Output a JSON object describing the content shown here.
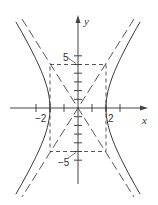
{
  "figure": {
    "type": "hyperbola-graph",
    "equation": "x^2/4 - y^2/25 = 1",
    "axes": {
      "x_label": "x",
      "y_label": "y",
      "x_range": [
        -4.9,
        4.9
      ],
      "y_range": [
        -9.0,
        10.5
      ],
      "x_ticks": [
        -3,
        -2,
        -1,
        1,
        2,
        3
      ],
      "y_ticks": [
        -6,
        -5,
        -4,
        -3,
        -2,
        -1,
        1,
        2,
        3,
        4,
        5,
        6
      ],
      "x_tick_labels": [
        {
          "value": -2,
          "text": "−2"
        },
        {
          "value": 2,
          "text": "2"
        }
      ],
      "y_tick_labels": [
        {
          "value": 5,
          "text": "5"
        },
        {
          "value": -5,
          "text": "−5"
        }
      ]
    },
    "vertices": [
      [
        -2,
        0
      ],
      [
        2,
        0
      ]
    ],
    "asymptotes": [
      "y = 5x/2",
      "y = -5x/2"
    ],
    "central_rectangle": {
      "x": [
        -2,
        2
      ],
      "y": [
        -5,
        5
      ],
      "style": "dashed"
    },
    "colors": {
      "curve": "#333333",
      "axis": "#444444",
      "dashed": "#444444"
    }
  },
  "labels": {
    "x_axis": "x",
    "y_axis": "y",
    "tick_neg2": "−2",
    "tick_pos2": "2",
    "tick_pos5": "5",
    "tick_neg5": "−5"
  }
}
